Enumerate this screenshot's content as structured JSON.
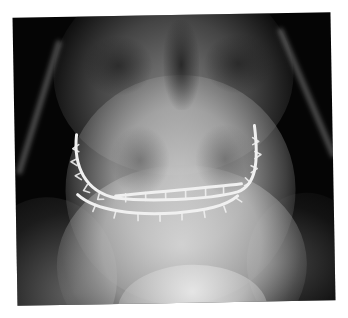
{
  "image": {
    "type": "radiograph",
    "subject": "frontal (PA) X-ray of facial skeleton with maxillary and mandibular wire arch bars (intermaxillary fixation)",
    "caption_fragment": "",
    "colors": {
      "background": "#ffffff",
      "film_dark": "#050505",
      "bone_light": "#d8d8d8",
      "wire_bright": "#f2f2f2"
    },
    "elements": [
      {
        "name": "skull-vault",
        "description": "cranial bones at top"
      },
      {
        "name": "orbits",
        "description": "left and right orbital regions"
      },
      {
        "name": "nasal-cavity",
        "description": "dark central nasal aperture"
      },
      {
        "name": "maxillary-sinuses",
        "description": "bilateral sinus shadows"
      },
      {
        "name": "upper-arch-bar",
        "description": "U-shaped bright wire along upper dental arch with ligature loops"
      },
      {
        "name": "middle-arch-bar",
        "description": "horizontal wire across occlusal plane"
      },
      {
        "name": "lower-arch-bar",
        "description": "horizontal wire along lower dental arch"
      },
      {
        "name": "mandible",
        "description": "lower jaw and chin region"
      },
      {
        "name": "neck-soft-tissue",
        "description": "bright soft tissue at bottom center"
      }
    ]
  }
}
